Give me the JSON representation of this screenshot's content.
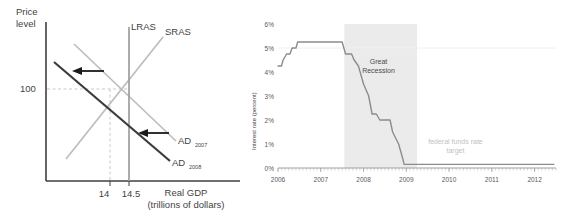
{
  "left_chart": {
    "title": "",
    "y_axis_label_line1": "Price",
    "y_axis_label_line2": "level",
    "x_axis_label_line1": "Real GDP",
    "x_axis_label_line2": "(trillions of dollars)",
    "y_tick": "100",
    "x_ticks": [
      "14",
      "14.5"
    ],
    "curves": [
      {
        "name": "LRAS",
        "label": "LRAS",
        "color": "#9e9e9e"
      },
      {
        "name": "SRAS",
        "label": "SRAS",
        "color": "#bdbdbd"
      },
      {
        "name": "AD2007",
        "label": "AD",
        "sub": "2007",
        "color": "#bdbdbd"
      },
      {
        "name": "AD2008",
        "label": "AD",
        "sub": "2008",
        "color": "#3b3b3b"
      }
    ],
    "arrows": [
      "shift-left-upper",
      "shift-left-lower"
    ],
    "axis_color": "#3f3f3f",
    "dash_color": "#c9c9c9"
  },
  "chart_data": {
    "type": "line",
    "title": "",
    "xlabel": "",
    "ylabel": "Interest rate (percent)",
    "x_tick_labels": [
      "2006",
      "2007",
      "2008",
      "2009",
      "2010",
      "2011",
      "2012"
    ],
    "y_tick_labels": [
      "0%",
      "1%",
      "2%",
      "3%",
      "4%",
      "5%",
      "6%"
    ],
    "xlim": [
      2006.0,
      2012.5
    ],
    "ylim": [
      0,
      6
    ],
    "grid": false,
    "legend": "none",
    "line_color": "#8c8c8c",
    "shade_color": "#ebebeb",
    "annotations": [
      {
        "text_line1": "Great",
        "text_line2": "Recession",
        "x": 2008.35,
        "y": 4.35
      },
      {
        "text_line1": "federal funds rate",
        "text_line2": "target",
        "x": 2010.15,
        "y": 1.0
      }
    ],
    "shaded_region": {
      "label": "Great Recession",
      "x_start": 2007.55,
      "x_end": 2009.25
    },
    "series": [
      {
        "name": "Federal funds rate target",
        "x": [
          2006.0,
          2006.08,
          2006.12,
          2006.2,
          2006.28,
          2006.33,
          2006.42,
          2006.46,
          2006.5,
          2007.5,
          2007.58,
          2007.72,
          2007.78,
          2007.88,
          2008.0,
          2008.12,
          2008.2,
          2008.3,
          2008.38,
          2008.44,
          2008.62,
          2008.68,
          2008.82,
          2008.9,
          2008.95,
          2012.45
        ],
        "y": [
          4.25,
          4.25,
          4.5,
          4.75,
          4.75,
          5.0,
          5.0,
          5.25,
          5.25,
          5.25,
          4.75,
          4.75,
          4.5,
          4.25,
          3.5,
          3.0,
          2.25,
          2.25,
          2.0,
          2.0,
          2.0,
          1.5,
          1.0,
          0.5,
          0.15,
          0.15
        ]
      }
    ]
  }
}
